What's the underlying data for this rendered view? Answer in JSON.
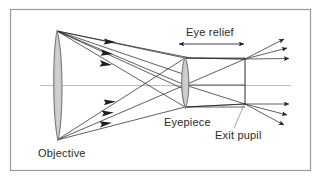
{
  "figure": {
    "type": "optical-ray-diagram",
    "background_color": "#ffffff",
    "border_color": "#9a9a9a",
    "ink_color": "#2b2b2b",
    "axis_color": "#b9b9b9",
    "lens_fill": "#c9c9c9",
    "lens_stroke": "#6e6e6e"
  },
  "labels": {
    "objective": "Objective",
    "eyepiece": "Eyepiece",
    "exit_pupil": "Exit pupil",
    "eye_relief": "Eye relief"
  },
  "elements": {
    "objective_lens": {
      "x": 57,
      "top_y": 30,
      "bottom_y": 141,
      "half_width": 6
    },
    "eyepiece_lens": {
      "x": 185,
      "top_y": 57,
      "bottom_y": 108,
      "half_width": 4.5
    },
    "exit_pupil_line": {
      "x": 245,
      "top_y": 58,
      "bottom_y": 105
    },
    "optical_axis": {
      "y": 85,
      "x_start": 40,
      "x_end": 290
    },
    "eye_relief_arrow": {
      "y": 44,
      "x_start": 178,
      "x_end": 245
    },
    "border": {
      "x": 10,
      "y": 9,
      "width": 301,
      "height": 162
    }
  },
  "ray_bundles": {
    "incoming_upper_arrowheads": 3,
    "incoming_lower_arrowheads": 3,
    "outgoing_upper_arrowheads": 3,
    "outgoing_lower_arrowheads": 3
  }
}
